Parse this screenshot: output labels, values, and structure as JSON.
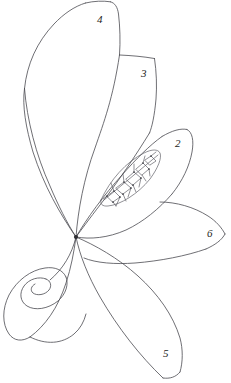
{
  "figure": {
    "background_color": "#ffffff",
    "stroke_color": "#4a4a50",
    "label_color": "#1d1d20",
    "width": 231,
    "height": 383
  },
  "hub": {
    "name": "convergence-point",
    "x": 76,
    "y": 237
  },
  "labels": [
    {
      "id": "2",
      "text": "2",
      "x": 175,
      "y": 138,
      "refers_to": "ornamented-lens-petal"
    },
    {
      "id": "3",
      "text": "3",
      "x": 141,
      "y": 68,
      "refers_to": "upper-middle-petal"
    },
    {
      "id": "4",
      "text": "4",
      "x": 97,
      "y": 14,
      "refers_to": "tall-left-petal"
    },
    {
      "id": "5",
      "text": "5",
      "x": 163,
      "y": 348,
      "refers_to": "lower-right-petal"
    },
    {
      "id": "6",
      "text": "6",
      "x": 207,
      "y": 228,
      "refers_to": "right-side-petal"
    }
  ],
  "elements": [
    {
      "name": "tall-left-petal",
      "label": "4",
      "description": "Large elongated petal sweeping from the convergence point up and to the left, apex at the top of the frame"
    },
    {
      "name": "upper-middle-petal",
      "label": "3",
      "description": "Elongated petal rising from the convergence point toward the upper right, flat angled tip"
    },
    {
      "name": "ornamented-lens-petal",
      "label": "2",
      "description": "Almond / lens shaped petal angled to the upper right containing an inner lattice ornament"
    },
    {
      "name": "right-side-petal",
      "label": "6",
      "description": "Narrow lens shaped petal extending horizontally to the right, pointed tip at the right edge"
    },
    {
      "name": "lower-right-petal",
      "label": "5",
      "description": "Long pointed leaf shape descending from the convergence point to the lower right"
    },
    {
      "name": "volute-spiral",
      "label": "",
      "description": "Scroll / volute spiral curling inward at the lower left, attached to the left petal stem"
    },
    {
      "name": "inner-lattice-ornament",
      "label": "",
      "description": "Chain of diamonds and squares filling the lens of petal 2"
    }
  ]
}
